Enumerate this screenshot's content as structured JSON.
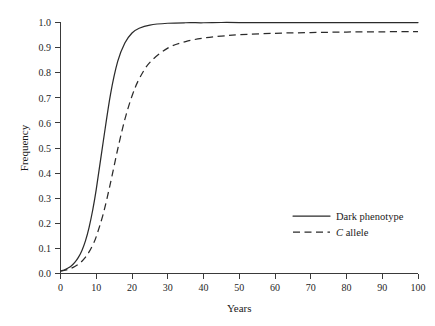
{
  "chart_data": {
    "type": "line",
    "title": "",
    "xlabel": "Years",
    "ylabel": "Frequency",
    "xlim": [
      0,
      100
    ],
    "ylim": [
      0.0,
      1.0
    ],
    "grid": false,
    "legend_position": "bottom-right",
    "x_ticks": [
      "0",
      "10",
      "20",
      "30",
      "40",
      "50",
      "60",
      "70",
      "80",
      "90",
      "100"
    ],
    "x_tick_values": [
      0,
      10,
      20,
      30,
      40,
      50,
      60,
      70,
      80,
      90,
      100
    ],
    "y_ticks": [
      "0.0",
      "0.1",
      "0.2",
      "0.3",
      "0.4",
      "0.5",
      "0.6",
      "0.7",
      "0.8",
      "0.9",
      "1.0"
    ],
    "y_tick_values": [
      0.0,
      0.1,
      0.2,
      0.3,
      0.4,
      0.5,
      0.6,
      0.7,
      0.8,
      0.9,
      1.0
    ],
    "x": [
      0,
      1,
      2,
      3,
      4,
      5,
      6,
      7,
      8,
      9,
      10,
      12,
      14,
      16,
      18,
      20,
      22,
      25,
      30,
      35,
      40,
      45,
      50,
      60,
      70,
      80,
      90,
      100
    ],
    "series": [
      {
        "name": "Dark phenotype",
        "style": "solid",
        "color": "#2b2b2b",
        "values": [
          0.01,
          0.014,
          0.021,
          0.03,
          0.044,
          0.064,
          0.092,
          0.131,
          0.184,
          0.252,
          0.335,
          0.53,
          0.715,
          0.845,
          0.918,
          0.958,
          0.977,
          0.99,
          0.997,
          0.999,
          0.999,
          1.0,
          1.0,
          1.0,
          1.0,
          1.0,
          1.0,
          1.0
        ]
      },
      {
        "name": "C allele",
        "style": "dashed",
        "color": "#2b2b2b",
        "name_italic_prefix": "C",
        "name_rest": " allele",
        "values": [
          0.01,
          0.012,
          0.016,
          0.021,
          0.028,
          0.037,
          0.049,
          0.065,
          0.086,
          0.113,
          0.147,
          0.24,
          0.362,
          0.495,
          0.614,
          0.707,
          0.775,
          0.841,
          0.898,
          0.924,
          0.938,
          0.946,
          0.951,
          0.957,
          0.96,
          0.962,
          0.963,
          0.964
        ]
      }
    ],
    "legend": [
      {
        "label": "Dark phenotype",
        "style": "solid"
      },
      {
        "label": "C allele",
        "style": "dashed",
        "italic_prefix": "C",
        "rest": " allele"
      }
    ]
  },
  "axes": {
    "y_label": "Frequency",
    "x_label": "Years"
  },
  "legend": {
    "item0_label": "Dark phenotype",
    "item1_italic": "C",
    "item1_rest": " allele"
  },
  "ticks": {
    "x": {
      "t0": "0",
      "t1": "10",
      "t2": "20",
      "t3": "30",
      "t4": "40",
      "t5": "50",
      "t6": "60",
      "t7": "70",
      "t8": "80",
      "t9": "90",
      "t10": "100"
    },
    "y": {
      "t0": "0.0",
      "t1": "0.1",
      "t2": "0.2",
      "t3": "0.3",
      "t4": "0.4",
      "t5": "0.5",
      "t6": "0.6",
      "t7": "0.7",
      "t8": "0.8",
      "t9": "0.9",
      "t10": "1.0"
    }
  }
}
